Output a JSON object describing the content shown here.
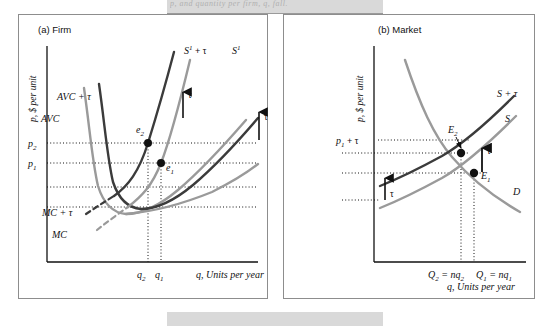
{
  "figure": {
    "cut_header_text": "p, and quantity per firm, q, fall.",
    "panels": [
      {
        "id": "a",
        "title": "(a) Firm",
        "y_axis_label": "p, $ per unit",
        "x_axis_label": "q, Units per year",
        "y_ticks": [
          "p",
          "p"
        ],
        "y_tick_labels": [
          {
            "base": "p",
            "sub": "2"
          },
          {
            "base": "p",
            "sub": "1"
          }
        ],
        "x_tick_labels": [
          {
            "base": "q",
            "sub": "2"
          },
          {
            "base": "q",
            "sub": "1"
          }
        ],
        "curve_labels": {
          "avc_tau": "AVC + τ",
          "avc": "AVC",
          "mc_tau": "MC + τ",
          "mc": "MC",
          "supply_tau": "S",
          "supply_tau_sup": "1",
          "supply_tau_suffix": "+ τ",
          "supply": "S",
          "supply_sup": "1"
        },
        "points": [
          {
            "label": "e",
            "sub": "2"
          },
          {
            "label": "e",
            "sub": "1"
          }
        ],
        "tau_arrows": [
          "τ",
          "τ"
        ]
      },
      {
        "id": "b",
        "title": "(b) Market",
        "y_axis_label": "p, $ per unit",
        "x_axis_label": "q, Units per year",
        "y_tick_labels": [
          {
            "base": "p",
            "sub": "1",
            "suffix": " + τ"
          }
        ],
        "x_tick_labels": [
          {
            "text": "Q",
            "sub": "2",
            "rest": " = nq",
            "rest_sub": "2"
          },
          {
            "text": "Q",
            "sub": "1",
            "rest": " = nq",
            "rest_sub": "1"
          }
        ],
        "curve_labels": {
          "supply_tau": "S + τ",
          "supply": "S",
          "demand": "D"
        },
        "points": [
          {
            "label": "E",
            "sub": "2"
          },
          {
            "label": "E",
            "sub": "1"
          }
        ],
        "tau_arrows": [
          "τ",
          "τ"
        ]
      }
    ]
  },
  "colors": {
    "dark_curve": "#3b3b3b",
    "light_curve": "#9a9a9a",
    "axis": "#111111",
    "dotted": "#111111",
    "frame": "#8d8d8d",
    "band": "#d9d9d9",
    "text": "#111111"
  }
}
